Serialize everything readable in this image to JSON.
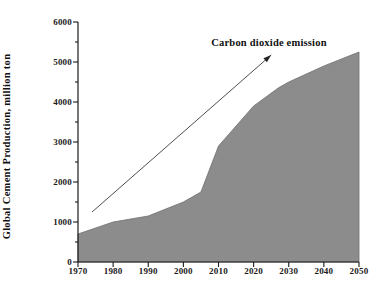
{
  "chart_data": {
    "type": "area",
    "title": "",
    "xlabel": "",
    "ylabel": "Global Cement Production, million ton",
    "xlim": [
      1970,
      2050
    ],
    "ylim": [
      0,
      6000
    ],
    "grid": false,
    "legend_position": "none",
    "x": [
      1970,
      1980,
      1990,
      2000,
      2005,
      2010,
      2020,
      2027,
      2030,
      2040,
      2050
    ],
    "values": [
      700,
      1000,
      1150,
      1500,
      1750,
      2900,
      3900,
      4350,
      4500,
      4900,
      5250
    ],
    "series": [
      {
        "name": "Global Cement Production",
        "values": [
          700,
          1000,
          1150,
          1500,
          1750,
          2900,
          3900,
          4350,
          4500,
          4900,
          5250
        ]
      }
    ],
    "xticks": [
      1970,
      1980,
      1990,
      2000,
      2010,
      2020,
      2030,
      2040,
      2050
    ],
    "xtick_labels": [
      "1970",
      "1980",
      "1990",
      "2000",
      "2010",
      "2020",
      "2030",
      "2040",
      "2050"
    ],
    "yticks": [
      0,
      1000,
      2000,
      3000,
      4000,
      5000,
      6000
    ],
    "ytick_labels": [
      "0",
      "1000",
      "2000",
      "3000",
      "4000",
      "5000",
      "6000"
    ],
    "y_minor_ticks": [
      500,
      1500,
      2500,
      3500,
      4500,
      5500
    ],
    "annotations": [
      {
        "text": "Carbon dioxide emission",
        "arrow_from_x": 1974,
        "arrow_from_y": 1250,
        "arrow_to_x": 2025,
        "arrow_to_y": 5175
      }
    ],
    "colors": {
      "area_fill": "#8c8c8c",
      "axis": "#1a1a1a",
      "text": "#111111",
      "annotation_arrow": "#3a3a3a",
      "background": "#ffffff"
    }
  }
}
